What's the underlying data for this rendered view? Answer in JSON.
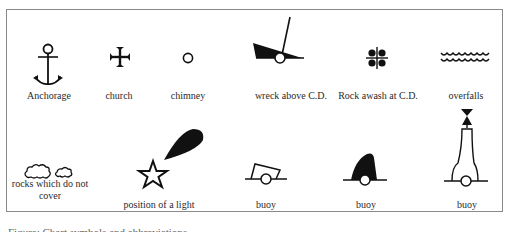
{
  "figure": {
    "caption": "Figure: Chart symbols and abbreviations",
    "symbols": [
      {
        "label": "Anchorage",
        "icon": "anchor-icon"
      },
      {
        "label": "church",
        "icon": "cross-pattee-icon"
      },
      {
        "label": "chimney",
        "icon": "small-circle-icon"
      },
      {
        "label": "wreck above C.D.",
        "icon": "wreck-icon"
      },
      {
        "label": "Rock awash at C.D.",
        "icon": "rock-awash-icon"
      },
      {
        "label": "overfalls",
        "icon": "wavy-lines-icon"
      },
      {
        "label": "rocks which do not cover",
        "icon": "rocks-cloud-icon"
      },
      {
        "label": "position of a light",
        "icon": "light-star-flare-icon"
      },
      {
        "label": "buoy",
        "icon": "can-buoy-icon"
      },
      {
        "label": "buoy",
        "icon": "conical-buoy-icon"
      },
      {
        "label": "buoy",
        "icon": "pillar-buoy-topmark-icon"
      }
    ]
  }
}
